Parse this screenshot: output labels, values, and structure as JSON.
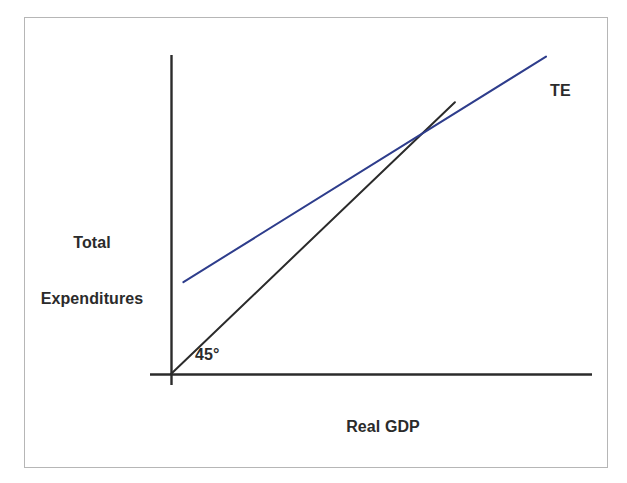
{
  "figure": {
    "kind": "keynesian-cross",
    "background_color": "#ffffff",
    "frame_border_color": "#b6b6b6"
  },
  "labels": {
    "y_axis_title_line1": "Total",
    "y_axis_title_line2": "Expenditures",
    "x_axis_title": "Real GDP",
    "angle_label": "45°",
    "te_curve_label": "TE"
  },
  "chart_data": {
    "type": "line",
    "title": "",
    "xlabel": "Real GDP",
    "ylabel": "Total Expenditures",
    "xlim": [
      0,
      100
    ],
    "ylim": [
      0,
      100
    ],
    "grid": false,
    "legend": "inline-curve-labels",
    "axis_color": "#2b2b2b",
    "series": [
      {
        "name": "45°",
        "label": "45°",
        "color": "#2b2b2b",
        "width": 2,
        "description": "45-degree reference line where total expenditures equal real GDP",
        "points": [
          {
            "x": 0,
            "y": 0
          },
          {
            "x": 75.7,
            "y": 75.7
          }
        ]
      },
      {
        "name": "TE",
        "label": "TE",
        "color": "#2e3d8c",
        "width": 2,
        "description": "Total expenditures schedule with positive autonomous intercept and slope less than one",
        "points": [
          {
            "x": 3.3,
            "y": 25.6
          },
          {
            "x": 100.0,
            "y": 88.4
          }
        ]
      }
    ],
    "annotations": [
      {
        "name": "equilibrium-intersection",
        "text": "",
        "x": 54.4,
        "y": 53.0
      },
      {
        "name": "angle-annotation",
        "text": "45°",
        "x": 7.6,
        "y": 8.5
      },
      {
        "name": "te-annotation",
        "text": "TE",
        "x": 101.0,
        "y": 91.0
      }
    ]
  }
}
